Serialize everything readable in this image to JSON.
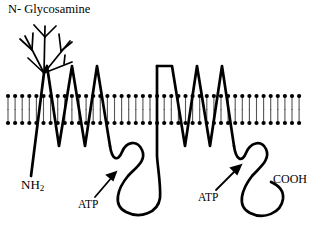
{
  "figure": {
    "title_text": "N- Glycosamine",
    "type": "membrane-protein-topology-diagram",
    "background_color": "#ffffff",
    "line_color": "#000000"
  },
  "labels": {
    "glycosamine": "N- Glycosamine",
    "n_terminus_prefix": "NH",
    "n_terminus_subscript": "2",
    "c_terminus": "COOH",
    "atp_first": "ATP",
    "atp_second": "ATP"
  },
  "membrane": {
    "name": "phospholipid-bilayer",
    "left_x": 8,
    "right_x": 306,
    "outer_leaflet_head_y": 96,
    "outer_leaflet_tail_end_y": 110,
    "inner_leaflet_head_y": 123,
    "inner_leaflet_tail_end_y": 109,
    "head_radius": 2.1,
    "lipid_spacing": 7.1,
    "head_color": "#000000",
    "tail_color": "#555555"
  },
  "protein": {
    "name": "transmembrane-protein-chain",
    "stroke_width": 2.6,
    "n_terminus_point": [
      31,
      176
    ],
    "glycan_junction": [
      44,
      73
    ],
    "transmembrane_helix_peaks_y": 66,
    "cytoplasmic_valley_y": 146,
    "helix_group_1_peak_x": [
      47,
      72,
      97
    ],
    "helix_group_2_peak_x": [
      172,
      197,
      222
    ],
    "c_terminus_point": [
      271,
      182
    ]
  },
  "glycan_tree": {
    "name": "n-linked-glycan-branches",
    "root": [
      44,
      73
    ],
    "branch_count": 3,
    "stroke_width": 1.6
  },
  "arrows": [
    {
      "name": "atp-arrow-first",
      "tail": [
        95,
        196
      ],
      "head": [
        115,
        173
      ]
    },
    {
      "name": "atp-arrow-second",
      "tail": [
        215,
        189
      ],
      "head": [
        240,
        166
      ]
    }
  ],
  "chart_data": {
    "type": "diagram",
    "title": "N- Glycosamine",
    "annotations": [
      "N- Glycosamine",
      "NH2",
      "ATP",
      "ATP",
      "COOH"
    ],
    "features": [
      {
        "label": "N- Glycosamine",
        "role": "extracellular N-linked glycosylation tree"
      },
      {
        "label": "NH2",
        "role": "amino terminus, extracellular"
      },
      {
        "label": "ATP",
        "role": "first nucleotide-binding domain, cytoplasmic"
      },
      {
        "label": "ATP",
        "role": "second nucleotide-binding domain, cytoplasmic"
      },
      {
        "label": "COOH",
        "role": "carboxy terminus, cytoplasmic"
      }
    ],
    "transmembrane_segments": 6,
    "membrane_leaflets": 2
  }
}
